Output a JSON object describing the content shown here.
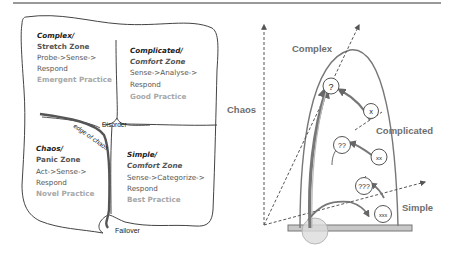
{
  "left_diagram": {
    "quadrants": [
      {
        "id": "complex",
        "title": "Complex/",
        "zone": "Stretch Zone",
        "steps_line1": "Probe->Sense->",
        "steps_line2": "Respond",
        "practice": "Emergent Practice"
      },
      {
        "id": "complicated",
        "title": "Complicated/",
        "zone": "Comfort Zone",
        "steps_line1": "Sense->Analyse->",
        "steps_line2": "Respond",
        "practice": "Good Practice"
      },
      {
        "id": "chaos",
        "title": "Chaos/",
        "zone": "Panic Zone",
        "steps_line1": "Act->Sense->",
        "steps_line2": "Respond",
        "practice": "Novel Practice"
      },
      {
        "id": "simple",
        "title": "Simple/",
        "zone": "Comfort Zone",
        "steps_line1": "Sense->Categorize->",
        "steps_line2": "Respond",
        "practice": "Best Practice"
      }
    ],
    "center_label": "Disorder",
    "edge_label": "edge of chaos",
    "bottom_label": "Failover"
  },
  "right_diagram": {
    "axis_labels": {
      "chaos": "Chaos",
      "complex": "Complex",
      "complicated": "Complicated",
      "simple": "Simple"
    },
    "nodes": [
      "?",
      "x",
      "??",
      "xx",
      "???",
      "xxx"
    ]
  },
  "colors": {
    "line": "#6a6a6a",
    "text_dark": "#222222",
    "text_mid": "#555555",
    "text_light": "#a8a8a8",
    "base_fill": "#c8c8c8",
    "circle_fill": "#e6e6e6"
  }
}
